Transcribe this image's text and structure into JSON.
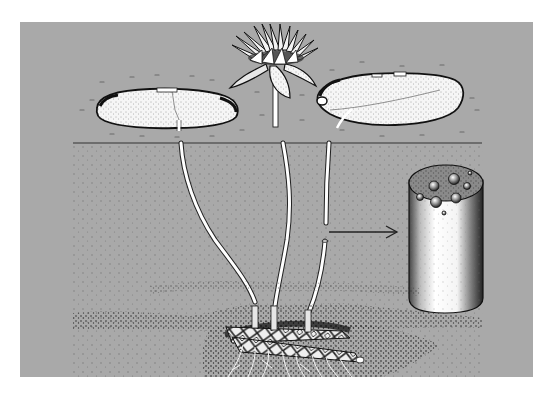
{
  "figure": {
    "colors": {
      "page_background": "#ffffff",
      "panel_background": "#a9a9a9",
      "water_stipple": "#6f6f6f",
      "ink": "#1a1a1a",
      "highlight": "#ffffff",
      "mud_dark": "#2b2b2b"
    },
    "panel": {
      "x": 20,
      "y": 22,
      "width": 513,
      "height": 355
    },
    "water_surface_y": 143,
    "elements": {
      "left_leaf": "floating-lily-pad",
      "flower": "water-lily-flower",
      "right_leaf": "floating-lily-pad",
      "stalks": [
        "left-leaf-stalk",
        "flower-stalk",
        "right-leaf-stalk"
      ],
      "arrow": "arrow pointing from cut stalk to enlarged cross-section",
      "cross_section": "stalk cross-section showing air channels",
      "rhizome": "rhizome with roots in mud"
    }
  }
}
